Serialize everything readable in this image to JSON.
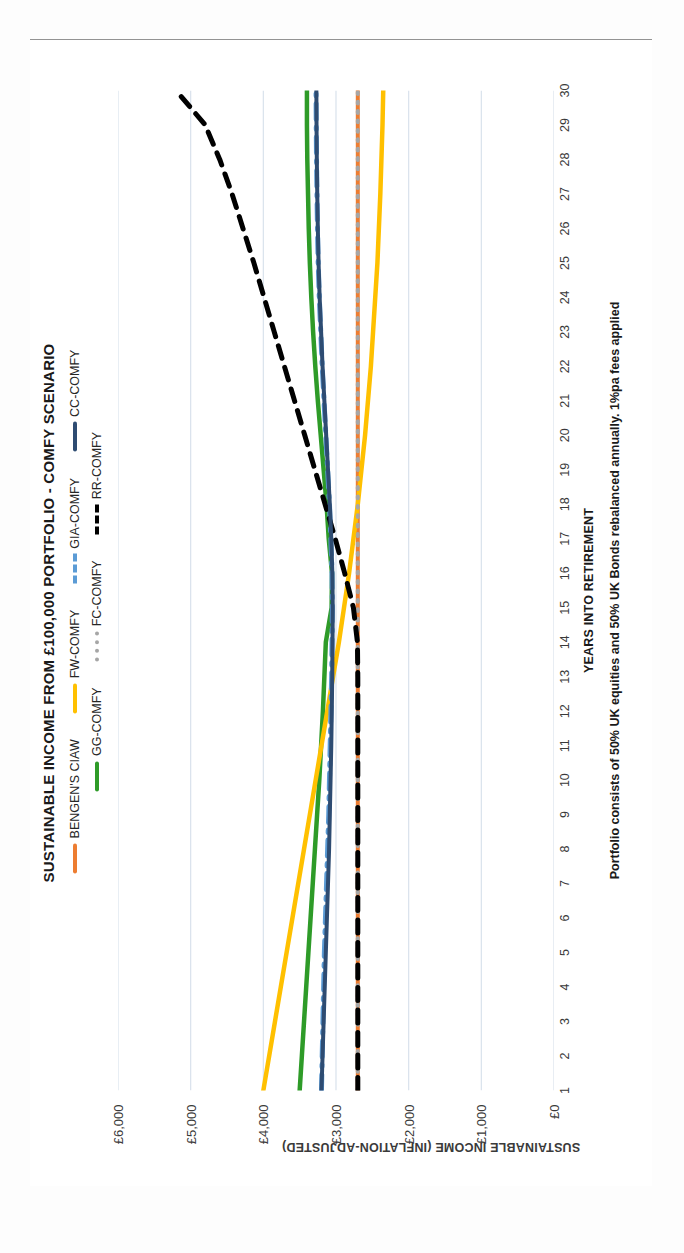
{
  "chart_data": {
    "type": "line",
    "title": "SUSTAINABLE INCOME FROM £100,000 PORTFOLIO - COMFY SCENARIO",
    "xlabel": "YEARS INTO RETIREMENT",
    "ylabel": "SUSTAINABLE INCOME (INFLATION-ADJUSTED)",
    "footnote": "Portfolio consists of 50% UK equities and 50% UK Bonds rebalanced annually.  1%pa fees applied",
    "grid": true,
    "legend_position": "top",
    "xlim": [
      1,
      30
    ],
    "ylim": [
      0,
      6000
    ],
    "ytick_values": [
      0,
      1000,
      2000,
      3000,
      4000,
      5000,
      6000
    ],
    "ytick_labels": [
      "£0",
      "£1,000",
      "£2,000",
      "£3,000",
      "£4,000",
      "£5,000",
      "£6,000"
    ],
    "x": [
      1,
      2,
      3,
      4,
      5,
      6,
      7,
      8,
      9,
      10,
      11,
      12,
      13,
      14,
      15,
      16,
      17,
      18,
      19,
      20,
      21,
      22,
      23,
      24,
      25,
      26,
      27,
      28,
      29,
      30
    ],
    "xtick_labels": [
      "1",
      "2",
      "3",
      "4",
      "5",
      "6",
      "7",
      "8",
      "9",
      "10",
      "11",
      "12",
      "13",
      "14",
      "15",
      "16",
      "17",
      "18",
      "19",
      "20",
      "21",
      "22",
      "23",
      "24",
      "25",
      "26",
      "27",
      "28",
      "29",
      "30"
    ],
    "series": [
      {
        "name": "BENGEN'S CIAW",
        "color": "#ED7D31",
        "style": "solid",
        "width": 4,
        "values": [
          2700,
          2700,
          2700,
          2700,
          2700,
          2700,
          2700,
          2700,
          2700,
          2700,
          2700,
          2700,
          2700,
          2700,
          2700,
          2700,
          2700,
          2700,
          2700,
          2700,
          2700,
          2700,
          2700,
          2700,
          2700,
          2700,
          2700,
          2700,
          2700,
          2700
        ]
      },
      {
        "name": "GG-COMFY",
        "color": "#2E9B28",
        "style": "solid",
        "width": 4.5,
        "values": [
          3500,
          3470,
          3440,
          3410,
          3380,
          3350,
          3320,
          3290,
          3260,
          3230,
          3205,
          3180,
          3160,
          3140,
          3060,
          3055,
          3100,
          3130,
          3170,
          3210,
          3250,
          3285,
          3315,
          3340,
          3360,
          3375,
          3385,
          3395,
          3400,
          3400
        ]
      },
      {
        "name": "FW-COMFY",
        "color": "#FFC000",
        "style": "solid",
        "width": 4.5,
        "values": [
          4000,
          3920,
          3840,
          3760,
          3680,
          3600,
          3520,
          3440,
          3360,
          3280,
          3200,
          3120,
          3040,
          2960,
          2890,
          2820,
          2760,
          2700,
          2650,
          2600,
          2560,
          2520,
          2490,
          2460,
          2430,
          2410,
          2390,
          2375,
          2360,
          2350
        ]
      },
      {
        "name": "FC-COMFY",
        "color": "#A6A6A6",
        "style": "dotted",
        "width": 4,
        "values": [
          2700,
          2700,
          2700,
          2700,
          2700,
          2700,
          2700,
          2700,
          2700,
          2700,
          2700,
          2700,
          2700,
          2700,
          2700,
          2700,
          2700,
          2700,
          2700,
          2700,
          2700,
          2700,
          2700,
          2700,
          2700,
          2700,
          2700,
          2700,
          2700,
          2700
        ]
      },
      {
        "name": "GIA-COMFY",
        "color": "#5B9BD5",
        "style": "dashdot",
        "width": 5,
        "values": [
          3200,
          3190,
          3180,
          3170,
          3160,
          3145,
          3130,
          3115,
          3100,
          3090,
          3080,
          3070,
          3060,
          3055,
          3050,
          3055,
          3070,
          3090,
          3115,
          3140,
          3165,
          3190,
          3210,
          3230,
          3245,
          3255,
          3262,
          3268,
          3272,
          3275
        ]
      },
      {
        "name": "RR-COMFY",
        "color": "#000000",
        "style": "dashed",
        "width": 5,
        "values": [
          2700,
          2700,
          2700,
          2700,
          2700,
          2700,
          2700,
          2700,
          2700,
          2700,
          2700,
          2700,
          2700,
          2705,
          2760,
          2880,
          3010,
          3150,
          3290,
          3430,
          3570,
          3710,
          3850,
          3990,
          4130,
          4280,
          4430,
          4600,
          4800,
          5200
        ]
      },
      {
        "name": "CC-COMFY",
        "color": "#2E4C72",
        "style": "solid",
        "width": 4,
        "values": [
          3200,
          3185,
          3170,
          3155,
          3140,
          3125,
          3110,
          3095,
          3085,
          3075,
          3065,
          3058,
          3052,
          3048,
          3045,
          3050,
          3065,
          3085,
          3110,
          3135,
          3160,
          3185,
          3205,
          3225,
          3240,
          3250,
          3258,
          3264,
          3268,
          3270
        ]
      }
    ]
  },
  "legend": {
    "row1": [
      {
        "label": "BENGEN'S CIAW",
        "color": "#ED7D31",
        "style": "solid",
        "swatch_name": "legend-swatch-bengens-ciaw"
      },
      {
        "label": "FW-COMFY",
        "color": "#FFC000",
        "style": "solid",
        "swatch_name": "legend-swatch-fw-comfy"
      },
      {
        "label": "GIA-COMFY",
        "color": "#5B9BD5",
        "style": "dashdot",
        "swatch_name": "legend-swatch-gia-comfy"
      },
      {
        "label": "CC-COMFY",
        "color": "#2E4C72",
        "style": "solid",
        "swatch_name": "legend-swatch-cc-comfy"
      }
    ],
    "row2": [
      {
        "label": "GG-COMFY",
        "color": "#2E9B28",
        "style": "solid",
        "swatch_name": "legend-swatch-gg-comfy"
      },
      {
        "label": "FC-COMFY",
        "color": "#A6A6A6",
        "style": "dotted",
        "swatch_name": "legend-swatch-fc-comfy"
      },
      {
        "label": "RR-COMFY",
        "color": "#000000",
        "style": "dashed",
        "swatch_name": "legend-swatch-rr-comfy"
      }
    ]
  },
  "colors": {
    "bengens": "#ED7D31",
    "gg": "#2E9B28",
    "fw": "#FFC000",
    "fc": "#A6A6A6",
    "gia": "#5B9BD5",
    "rr": "#000000",
    "cc": "#2E4C72",
    "gridline": "#D9E2EC",
    "frame": "#262626",
    "text": "#262626"
  }
}
